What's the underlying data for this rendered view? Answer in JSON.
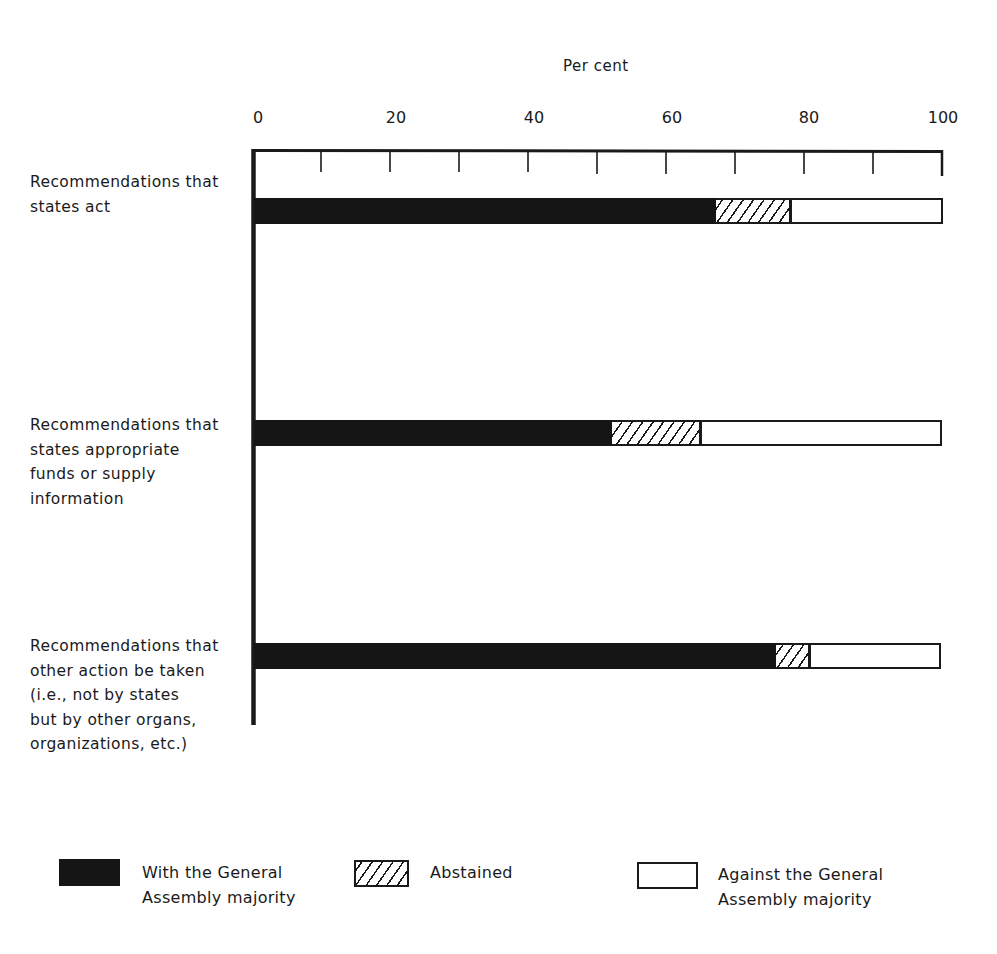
{
  "chart_data": {
    "type": "bar",
    "orientation": "horizontal",
    "stacked": true,
    "title": "",
    "xlabel": "Per cent",
    "ylabel": "",
    "xlim": [
      0,
      100
    ],
    "x_ticks": [
      0,
      20,
      40,
      60,
      80,
      100
    ],
    "minor_ticks_every": 10,
    "grid": false,
    "legend_position": "bottom",
    "categories": [
      "Recommendations that states act",
      "Recommendations that states appropriate funds or supply information",
      "Recommendations that other action be taken (i.e., not by states but by other organs, organizations, etc.)"
    ],
    "series": [
      {
        "name": "With the General Assembly majority",
        "pattern": "solid-black",
        "values": [
          67,
          52,
          76
        ]
      },
      {
        "name": "Abstained",
        "pattern": "hatched",
        "values": [
          11,
          13,
          5
        ]
      },
      {
        "name": "Against the General Assembly majority",
        "pattern": "white",
        "values": [
          22,
          35,
          19
        ]
      }
    ]
  },
  "axis": {
    "title": "Per cent",
    "tick_labels": [
      "0",
      "20",
      "40",
      "60",
      "80",
      "100"
    ]
  },
  "category_labels": [
    [
      "Recommendations that",
      "states act"
    ],
    [
      "Recommendations that",
      "states appropriate",
      "funds or supply",
      "information"
    ],
    [
      "Recommendations that",
      "other action be taken",
      "(i.e., not by states",
      "but by other organs,",
      "organizations, etc.)"
    ]
  ],
  "legend": [
    {
      "lines": [
        "With the General",
        "Assembly majority"
      ],
      "swatch": "solid-black"
    },
    {
      "lines": [
        "Abstained"
      ],
      "swatch": "hatched"
    },
    {
      "lines": [
        "Against the General",
        "Assembly majority"
      ],
      "swatch": "white"
    }
  ]
}
